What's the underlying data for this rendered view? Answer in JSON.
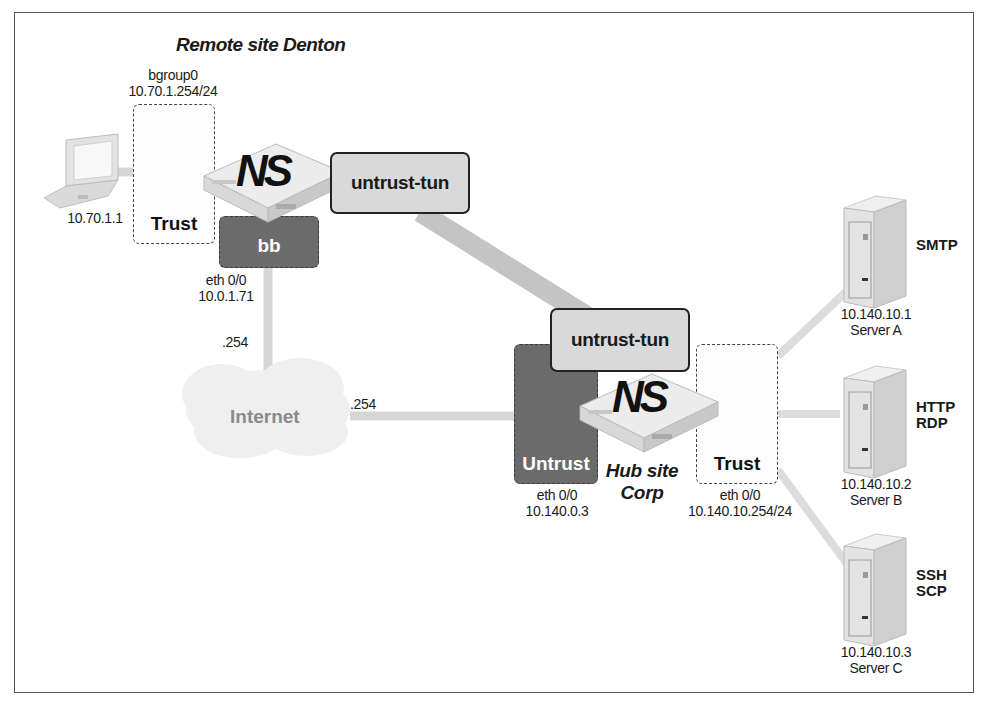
{
  "diagram": {
    "title": "Remote site Denton",
    "remote_site": {
      "laptop": {
        "icon": "laptop-icon",
        "ip": "10.70.1.1"
      },
      "trust_zone": {
        "label": "Trust",
        "interface": "bgroup0",
        "ip": "10.70.1.254/24"
      },
      "device": {
        "icon": "netscreen-firewall-icon",
        "label": "NS"
      },
      "bb_zone": {
        "label": "bb",
        "interface": "eth 0/0",
        "ip": "10.0.1.71"
      },
      "tunnel": {
        "label": "untrust-tun"
      },
      "gateway_suffix": ".254"
    },
    "internet": {
      "label": "Internet",
      "icon": "cloud-icon",
      "gateway_suffix": ".254"
    },
    "hub_site": {
      "name_line1": "Hub site",
      "name_line2": "Corp",
      "device": {
        "icon": "netscreen-firewall-icon",
        "label": "NS"
      },
      "tunnel": {
        "label": "untrust-tun"
      },
      "untrust_zone": {
        "label": "Untrust",
        "interface": "eth 0/0",
        "ip": "10.140.0.3"
      },
      "trust_zone": {
        "label": "Trust",
        "interface": "eth 0/0",
        "ip": "10.140.10.254/24"
      }
    },
    "servers": [
      {
        "name": "Server A",
        "ip": "10.140.10.1",
        "services": [
          "SMTP"
        ],
        "icon": "server-tower-icon"
      },
      {
        "name": "Server B",
        "ip": "10.140.10.2",
        "services": [
          "HTTP",
          "RDP"
        ],
        "icon": "server-tower-icon"
      },
      {
        "name": "Server C",
        "ip": "10.140.10.3",
        "services": [
          "SSH",
          "SCP"
        ],
        "icon": "server-tower-icon"
      }
    ],
    "colors": {
      "link": "#d6d6d6",
      "tunnel_link": "#c4c4c4",
      "dark_zone": "#6b6b6b",
      "tunnel_box": "#d9d9d9",
      "frame": "#555555"
    }
  }
}
